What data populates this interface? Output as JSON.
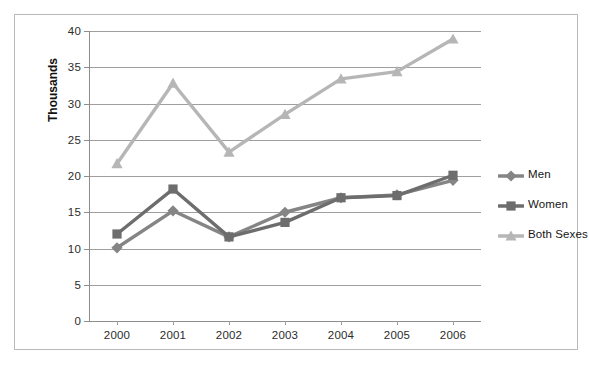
{
  "chart_data": {
    "type": "line",
    "title": "",
    "xlabel": "",
    "ylabel": "Thousands",
    "categories": [
      "2000",
      "2001",
      "2002",
      "2003",
      "2004",
      "2005",
      "2006"
    ],
    "ylim": [
      0,
      40
    ],
    "yticks": [
      0,
      5,
      10,
      15,
      20,
      25,
      30,
      35,
      40
    ],
    "ytick_labels": [
      "0",
      "5",
      "10",
      "15",
      "20",
      "25",
      "30",
      "35",
      "40"
    ],
    "grid": true,
    "legend_position": "right",
    "series": [
      {
        "name": "Men",
        "marker": "diamond",
        "color": "#858585",
        "values": [
          10.1,
          15.2,
          11.6,
          15.0,
          17.0,
          17.4,
          19.4
        ]
      },
      {
        "name": "Women",
        "marker": "square",
        "color": "#6d6d6d",
        "values": [
          12.0,
          18.2,
          11.6,
          13.6,
          17.0,
          17.3,
          20.1
        ]
      },
      {
        "name": "Both Sexes",
        "marker": "triangle",
        "color": "#b6b6b6",
        "values": [
          21.7,
          32.8,
          23.3,
          28.5,
          33.4,
          34.4,
          38.9
        ]
      }
    ]
  },
  "axis": {
    "y_title": "Thousands"
  },
  "legend": {
    "items": [
      {
        "label": "Men"
      },
      {
        "label": "Women"
      },
      {
        "label": "Both Sexes"
      }
    ]
  },
  "colors": {
    "men": "#858585",
    "women": "#6d6d6d",
    "both_sexes": "#b6b6b6",
    "gridline": "#9f9f9f",
    "frame": "#b9b9b9"
  }
}
